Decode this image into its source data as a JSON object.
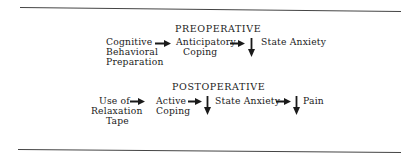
{
  "sections": {
    "preoperative": {
      "heading": "PREOPERATIVE",
      "node1": {
        "line1": "Cognitive",
        "line2": "Behavioral",
        "line3": "Preparation"
      },
      "node2": {
        "line1": "Anticipatory",
        "line2": "Coping"
      },
      "node3": {
        "label": "State Anxiety",
        "direction": "decrease"
      }
    },
    "postoperative": {
      "heading": "POSTOPERATIVE",
      "node1": {
        "line1": "Use of",
        "line2": "Relaxation",
        "line3": "Tape"
      },
      "node2": {
        "line1": "Active",
        "line2": "Coping"
      },
      "node3": {
        "label": "State Anxiety",
        "direction": "decrease"
      },
      "node4": {
        "label": "Pain",
        "direction": "decrease"
      }
    }
  },
  "colors": {
    "ink": "#1a1a1a",
    "rule": "#444444",
    "background": "#ffffff"
  }
}
